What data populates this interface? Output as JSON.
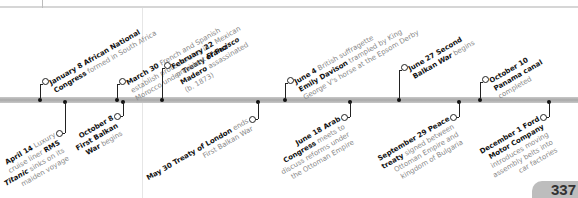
{
  "page_number": "337",
  "timeline": {
    "above": [
      {
        "date": "January 8",
        "text_html": "<b>January 8</b> <b>African National</b><br><b>Congress</b> formed in South Africa",
        "x": 40
      },
      {
        "date": "March 30",
        "text_html": "<b>March 30</b> French and Spanish<br>establish protectorates in<br>Morocco under <b>Treaty of Fez</b>",
        "x": 117
      },
      {
        "date": "February 22",
        "text_html": "<b>February 22</b> Mexican<br>president <i class=\"b\">Francisco</i><br><b>Madero</b> assassinated<br>(b. 1873)",
        "x": 162
      },
      {
        "date": "June 4",
        "text_html": "<b>June 4</b> British suffragette<br><b>Emily Davison</b> trampled by King<br>George V's horse at the Epsom Derby",
        "x": 285
      },
      {
        "date": "June 27",
        "text_html": "<b>June 27 Second</b><br><b>Balkan</b> <i class=\"b\">War</i> begins",
        "x": 399
      },
      {
        "date": "October 10",
        "text_html": "<b>October 10</b><br><b>Panama canal</b><br>completed",
        "x": 480
      }
    ],
    "below": [
      {
        "date": "April 14",
        "text_html": "<b>April 14</b> Luxury<br>cruise liner <b>RMS</b><br><i class=\"b\">Titanic</i> sinks on its<br>maiden voyage",
        "x": 65
      },
      {
        "date": "October 8",
        "text_html": "<b>October 8</b><br><b>First Balkan</b><br><b>War</b> begins",
        "x": 123
      },
      {
        "date": "May 30",
        "text_html": "<b>May 30 Treaty of London</b> ends<br>First Balkan War",
        "x": 258
      },
      {
        "date": "June 18",
        "text_html": "<b>June 18 Arab</b><br><b>Congress</b> meets to<br>discuss reforms under<br>the Ottoman Empire",
        "x": 350
      },
      {
        "date": "September 29",
        "text_html": "<b>September 29 Peace</b><br><b>treaty</b> signed between<br>Ottoman Empire and<br>kingdom of Bulgaria",
        "x": 459
      },
      {
        "date": "December 1",
        "text_html": "<b>December 1 Ford</b><br><b>Motor Company</b><br>introduces moving<br>assembly belts into<br>car factories",
        "x": 549
      }
    ]
  }
}
